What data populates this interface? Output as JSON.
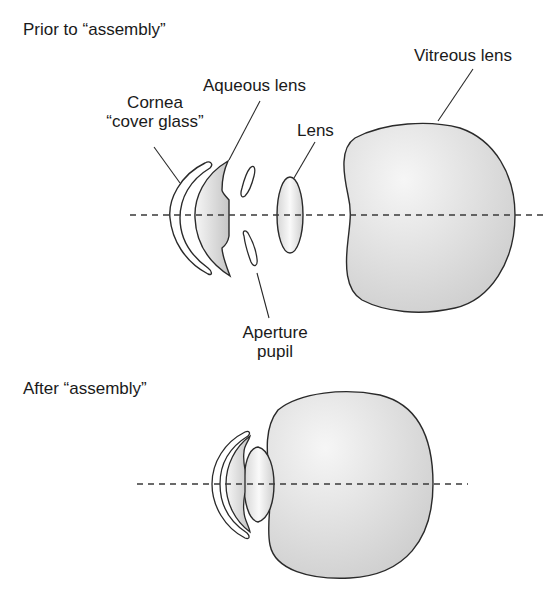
{
  "sections": {
    "before": {
      "title": "Prior to “assembly”",
      "labels": {
        "cornea_line1": "Cornea",
        "cornea_line2": "“cover glass”",
        "aqueous": "Aqueous lens",
        "lens": "Lens",
        "vitreous": "Vitreous lens",
        "aperture_line1": "Aperture",
        "aperture_line2": "pupil"
      }
    },
    "after": {
      "title": "After “assembly”"
    }
  },
  "colors": {
    "stroke": "#2a2a2a",
    "fill_light": "#f4f4f4",
    "fill_shade": "#cfcfcf",
    "axis": "#3a3a3a"
  }
}
